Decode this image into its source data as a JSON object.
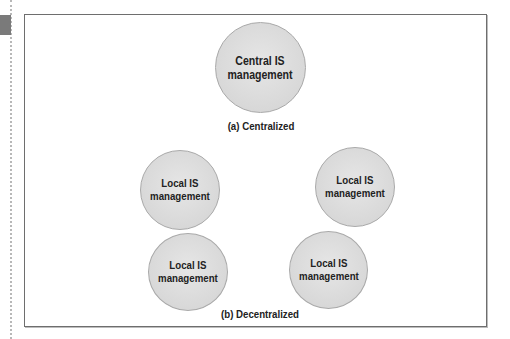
{
  "diagram": {
    "centralized": {
      "caption": "(a) Centralized",
      "node": {
        "line1": "Central IS",
        "line2": "management"
      }
    },
    "decentralized": {
      "caption": "(b) Decentralized",
      "nodes": [
        {
          "line1": "Local IS",
          "line2": "management"
        },
        {
          "line1": "Local IS",
          "line2": "management"
        },
        {
          "line1": "Local IS",
          "line2": "management"
        },
        {
          "line1": "Local IS",
          "line2": "management"
        }
      ]
    }
  },
  "colors": {
    "node_fill": "#d8d8d8",
    "node_border": "#a9a9a9",
    "frame_border": "#6e6e6e",
    "margin_tab": "#7a7a7a"
  }
}
